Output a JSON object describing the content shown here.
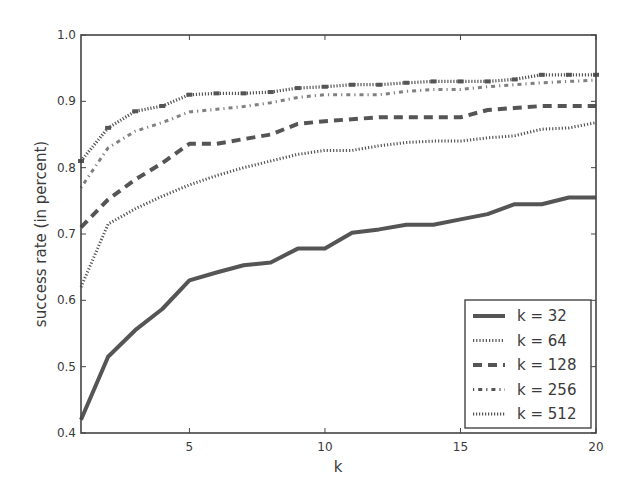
{
  "chart_data": {
    "type": "line",
    "title": "",
    "xlabel": "k",
    "ylabel": "success rate (in percent)",
    "xlim": [
      1,
      20
    ],
    "ylim": [
      0.4,
      1.0
    ],
    "xticks": [
      5,
      10,
      15,
      20
    ],
    "yticks": [
      0.4,
      0.5,
      0.6,
      0.7,
      0.8,
      0.9,
      1.0
    ],
    "ytick_labels": [
      "0.4",
      "0.5",
      "0.6",
      "0.7",
      "0.8",
      "0.9",
      "1.0"
    ],
    "grid": false,
    "legend_position": "lower right",
    "x": [
      1,
      2,
      3,
      4,
      5,
      6,
      7,
      8,
      9,
      10,
      11,
      12,
      13,
      14,
      15,
      16,
      17,
      18,
      19,
      20
    ],
    "series": [
      {
        "name": "k = 32",
        "style": "solid",
        "values": [
          0.42,
          0.515,
          0.555,
          0.587,
          0.63,
          0.642,
          0.653,
          0.657,
          0.678,
          0.678,
          0.702,
          0.707,
          0.714,
          0.714,
          0.722,
          0.73,
          0.745,
          0.745,
          0.755,
          0.755
        ]
      },
      {
        "name": "k = 64",
        "style": "dotted",
        "values": [
          0.62,
          0.715,
          0.738,
          0.757,
          0.774,
          0.788,
          0.8,
          0.81,
          0.82,
          0.826,
          0.826,
          0.833,
          0.838,
          0.84,
          0.84,
          0.845,
          0.848,
          0.858,
          0.86,
          0.868
        ]
      },
      {
        "name": "k = 128",
        "style": "dashed",
        "values": [
          0.71,
          0.752,
          0.782,
          0.807,
          0.836,
          0.836,
          0.843,
          0.85,
          0.866,
          0.87,
          0.873,
          0.876,
          0.876,
          0.876,
          0.876,
          0.887,
          0.89,
          0.893,
          0.893,
          0.893
        ]
      },
      {
        "name": "k = 256",
        "style": "dashdot",
        "values": [
          0.77,
          0.83,
          0.855,
          0.868,
          0.884,
          0.888,
          0.892,
          0.898,
          0.906,
          0.91,
          0.91,
          0.91,
          0.915,
          0.918,
          0.918,
          0.922,
          0.925,
          0.928,
          0.93,
          0.932
        ]
      },
      {
        "name": "k = 512",
        "style": "dotmarker",
        "values": [
          0.81,
          0.86,
          0.885,
          0.893,
          0.91,
          0.912,
          0.912,
          0.914,
          0.92,
          0.922,
          0.925,
          0.925,
          0.928,
          0.93,
          0.93,
          0.93,
          0.933,
          0.94,
          0.94,
          0.94
        ]
      }
    ]
  },
  "legend": {
    "items": [
      {
        "label": "k = 32"
      },
      {
        "label": "k = 64"
      },
      {
        "label": "k = 128"
      },
      {
        "label": "k = 256"
      },
      {
        "label": "k = 512"
      }
    ]
  },
  "axes": {
    "xlabel": "k",
    "ylabel": "success rate (in percent)",
    "xtick_labels": [
      "5",
      "10",
      "15",
      "20"
    ],
    "ytick_labels": [
      "0.4",
      "0.5",
      "0.6",
      "0.7",
      "0.8",
      "0.9",
      "1.0"
    ]
  },
  "colors": {
    "line": "#555555",
    "axis": "#444444",
    "text": "#3a3a3a"
  }
}
